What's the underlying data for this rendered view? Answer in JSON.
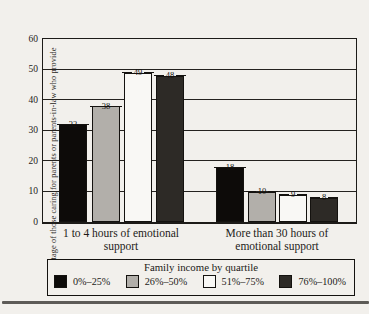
{
  "page": {
    "background": "#f2f0ec"
  },
  "chart_data": {
    "type": "bar",
    "title": "",
    "ylabel": "Percentage of those caring for parents or parents-in-law who provide",
    "xlabel": "",
    "ylim": [
      0,
      60
    ],
    "yticks": [
      0,
      10,
      20,
      30,
      40,
      50,
      60
    ],
    "grid": true,
    "categories": [
      "1 to 4 hours of emotional support",
      "More than 30 hours of emotional support"
    ],
    "series": [
      {
        "name": "0%–25%",
        "color": "#0d0b09",
        "values": [
          32,
          18
        ]
      },
      {
        "name": "26%–50%",
        "color": "#b2afaa",
        "values": [
          38,
          10
        ]
      },
      {
        "name": "51%–75%",
        "color": "#f9f8f5",
        "values": [
          49,
          9
        ]
      },
      {
        "name": "76%–100%",
        "color": "#2d2a26",
        "values": [
          48,
          8
        ]
      }
    ],
    "legend": {
      "title": "Family income by quartile",
      "position": "bottom"
    }
  }
}
